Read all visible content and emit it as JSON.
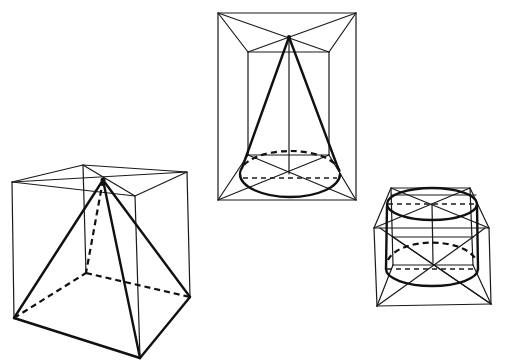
{
  "figure": {
    "stroke_color": "#111111",
    "background": "#ffffff",
    "shapes": [
      {
        "name": "pyramid-in-cube",
        "solid": "square pyramid",
        "container": "cube",
        "position": "bottom-left"
      },
      {
        "name": "cone-in-box",
        "solid": "cone",
        "container": "rectangular box (frontal view)",
        "position": "top-center"
      },
      {
        "name": "cylinder-in-box",
        "solid": "cylinder",
        "container": "rectangular box",
        "position": "right"
      }
    ]
  }
}
